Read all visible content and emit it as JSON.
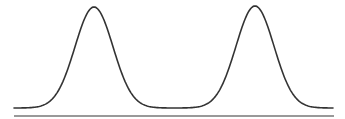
{
  "diagram": {
    "type": "bimodal-distribution-curve",
    "width": 345,
    "height": 119,
    "colors": {
      "background": "#ffffff",
      "curve": "#333333",
      "baseline": "#777777"
    },
    "baseline": {
      "x1": 14,
      "x2": 334,
      "y": 116,
      "stroke_width": 1.6
    },
    "curve": {
      "stroke_width": 1.6,
      "start": {
        "x": 14,
        "y": 107
      },
      "end": {
        "x": 333,
        "y": 106
      },
      "peaks": [
        {
          "x": 94,
          "y": 7
        },
        {
          "x": 255,
          "y": 6
        }
      ],
      "trough": {
        "x": 174,
        "y": 105
      },
      "baseline_level": 108,
      "sigma": 19
    }
  }
}
